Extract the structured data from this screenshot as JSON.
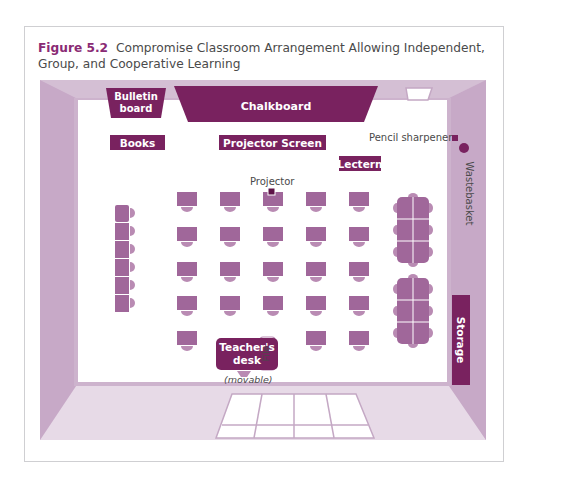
{
  "figure": {
    "number": "Figure 5.2",
    "title": "Compromise Classroom Arrangement Allowing Independent, Group, and Cooperative Learning"
  },
  "labels": {
    "bulletin_board": "Bulletin board",
    "bulletin_line1": "Bulletin",
    "bulletin_line2": "board",
    "chalkboard": "Chalkboard",
    "books": "Books",
    "projector_screen": "Projector Screen",
    "lectern": "Lectern",
    "pencil_sharpener": "Pencil sharpener",
    "wastebasket": "Wastebasket",
    "projector": "Projector",
    "storage": "Storage",
    "teachers_desk_line1": "Teacher's",
    "teachers_desk_line2": "desk",
    "file": "File",
    "movable": "(movable)"
  },
  "layout": {
    "student_desk_rows": 5,
    "student_desk_cols": 5,
    "last_row_missing_cols": [
      2,
      3
    ],
    "left_wall_desks": 6,
    "group_tables": 2,
    "seats_per_group_table": 8
  },
  "colors": {
    "accent": "#79225f",
    "desk": "#a0679a",
    "wall_light": "#e6d8e6",
    "wall_mid": "#d3bcd3",
    "wall_dark": "#c2a3c2",
    "caption_accent": "#8a2a74"
  }
}
